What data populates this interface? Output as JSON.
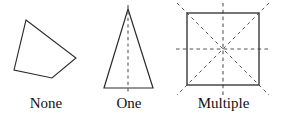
{
  "figure": {
    "stroke_color": "#2b2b2b",
    "dash_color": "#555555",
    "background_color": "#ffffff",
    "width": 281,
    "height": 119
  },
  "items": [
    {
      "label": "None",
      "shape": "irregular-quadrilateral",
      "symmetry_lines": 0,
      "vertices": [
        [
          26,
          20
        ],
        [
          76,
          58
        ],
        [
          52,
          78
        ],
        [
          14,
          70
        ]
      ]
    },
    {
      "label": "One",
      "shape": "isosceles-triangle",
      "symmetry_lines": 1,
      "vertices": [
        [
          128,
          9
        ],
        [
          153,
          88
        ],
        [
          104,
          88
        ]
      ],
      "dashed_lines": [
        [
          128,
          5,
          128,
          94
        ]
      ]
    },
    {
      "label": "Multiple",
      "shape": "square",
      "symmetry_lines": 4,
      "vertices": [
        [
          187,
          13
        ],
        [
          259,
          13
        ],
        [
          259,
          85
        ],
        [
          187,
          85
        ]
      ],
      "dashed_lines": [
        [
          223,
          3,
          223,
          95
        ],
        [
          176,
          49,
          271,
          49
        ],
        [
          177,
          3,
          269,
          95
        ],
        [
          269,
          3,
          177,
          95
        ]
      ]
    }
  ]
}
